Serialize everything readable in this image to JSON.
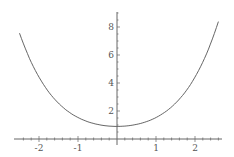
{
  "chart_data": {
    "type": "line",
    "title": "",
    "xlabel": "",
    "ylabel": "",
    "xlim": [
      -2.5,
      2.6
    ],
    "ylim": [
      0,
      9.2
    ],
    "x_ticks": [
      "-2",
      "-1",
      "1",
      "2"
    ],
    "y_ticks": [
      "2",
      "4",
      "6",
      "8"
    ],
    "grid": false,
    "series": [
      {
        "name": "f(x)",
        "x": [
          -2.5,
          -2,
          -1.5,
          -1,
          -0.5,
          0,
          0.5,
          1,
          1.5,
          2,
          2.5
        ],
        "values": [
          9.0,
          4.6,
          2.6,
          1.6,
          1.1,
          0.9,
          1.1,
          1.6,
          2.6,
          4.6,
          9.0
        ]
      }
    ]
  }
}
